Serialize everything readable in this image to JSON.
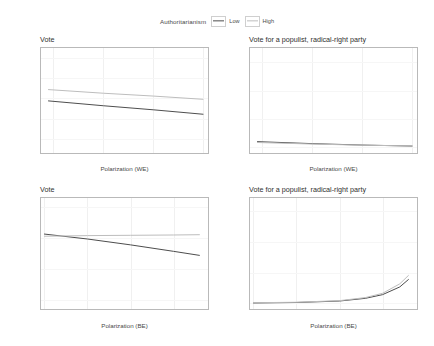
{
  "legend": {
    "title": "Authoritarianism",
    "entries": [
      {
        "label": "Low",
        "color": "#4d4d4d"
      },
      {
        "label": "High",
        "color": "#bdbdbd"
      }
    ]
  },
  "chart_data": {
    "type": "line",
    "layout": "2x2 facet grid",
    "grid": true,
    "legend_position": "top",
    "colors": {
      "low": "#4d4d4d",
      "high": "#bdbdbd",
      "axis": "#6e6e6e",
      "panel_border": "#b9b9b9"
    },
    "panels": [
      {
        "id": "top-left",
        "title": "Vote",
        "xlabel": "Polarization (WE)",
        "ylabel": "",
        "xlim": [
          -0.45,
          0.22
        ],
        "ylim": [
          0.565,
          0.825
        ],
        "xticks": [
          -0.4,
          -0.2,
          0.0,
          0.2
        ],
        "xticklabels": [
          "-0.4",
          "-0.2",
          "0.0",
          "0.2"
        ],
        "yticks": [
          0.6,
          0.65,
          0.7,
          0.75,
          0.8
        ],
        "yticklabels": [
          "60%",
          "65%",
          "70%",
          "75%",
          "80%"
        ],
        "series": [
          {
            "name": "Low",
            "x": [
              -0.42,
              -0.2,
              0.0,
              0.2
            ],
            "values": [
              0.694,
              0.682,
              0.672,
              0.661
            ]
          },
          {
            "name": "High",
            "x": [
              -0.42,
              -0.2,
              0.0,
              0.2
            ],
            "values": [
              0.722,
              0.713,
              0.706,
              0.698
            ]
          }
        ]
      },
      {
        "id": "top-right",
        "title": "Vote for a populist, radical-right party",
        "xlabel": "Polarization (WE)",
        "ylabel": "",
        "xlim": [
          -0.45,
          0.22
        ],
        "ylim": [
          -0.04,
          0.7
        ],
        "xticks": [
          -0.4,
          -0.2,
          0.0,
          0.2
        ],
        "xticklabels": [
          "-0.4",
          "-0.2",
          "0.0",
          "0.2"
        ],
        "yticks": [
          0.0,
          0.2,
          0.4,
          0.6
        ],
        "yticklabels": [
          "0%",
          "20%",
          "40%",
          "60%"
        ],
        "series": [
          {
            "name": "Low",
            "x": [
              -0.42,
              -0.2,
              0.0,
              0.2
            ],
            "values": [
              0.04,
              0.026,
              0.016,
              0.009
            ]
          },
          {
            "name": "High",
            "x": [
              -0.42,
              -0.2,
              0.0,
              0.2
            ],
            "values": [
              0.034,
              0.023,
              0.015,
              0.01
            ]
          }
        ]
      },
      {
        "id": "bottom-left",
        "title": "Vote",
        "xlabel": "Polarization (BE)",
        "ylabel": "",
        "xlim": [
          -0.02,
          0.95
        ],
        "ylim": [
          0.47,
          0.83
        ],
        "xticks": [
          0.0,
          0.25,
          0.5,
          0.75
        ],
        "xticklabels": [
          "0.00",
          "0.25",
          "0.50",
          "0.75"
        ],
        "yticks": [
          0.5,
          0.6,
          0.7,
          0.8
        ],
        "yticklabels": [
          "50%",
          "60%",
          "70%",
          "80%"
        ],
        "series": [
          {
            "name": "Low",
            "x": [
              0.0,
              0.25,
              0.5,
              0.75,
              0.9
            ],
            "values": [
              0.713,
              0.697,
              0.678,
              0.657,
              0.644
            ]
          },
          {
            "name": "High",
            "x": [
              0.0,
              0.25,
              0.5,
              0.75,
              0.9
            ],
            "values": [
              0.706,
              0.708,
              0.709,
              0.71,
              0.711
            ]
          }
        ]
      },
      {
        "id": "bottom-right",
        "title": "Vote for a populist, radical-right party",
        "xlabel": "Polarization (BE)",
        "ylabel": "",
        "xlim": [
          -0.02,
          0.95
        ],
        "ylim": [
          -0.045,
          0.86
        ],
        "xticks": [
          0.0,
          0.25,
          0.5,
          0.75
        ],
        "xticklabels": [
          "0.00",
          "0.25",
          "0.50",
          "0.75"
        ],
        "yticks": [
          0.0,
          0.25,
          0.5,
          0.75
        ],
        "yticklabels": [
          "0%",
          "25%",
          "50%",
          "75%"
        ],
        "series": [
          {
            "name": "Low",
            "x": [
              0.0,
              0.25,
              0.5,
              0.65,
              0.75,
              0.85,
              0.9
            ],
            "values": [
              0.004,
              0.008,
              0.02,
              0.042,
              0.072,
              0.135,
              0.195
            ]
          },
          {
            "name": "High",
            "x": [
              0.0,
              0.25,
              0.5,
              0.65,
              0.75,
              0.85,
              0.9
            ],
            "values": [
              0.006,
              0.01,
              0.023,
              0.048,
              0.083,
              0.16,
              0.228
            ]
          }
        ]
      }
    ]
  }
}
